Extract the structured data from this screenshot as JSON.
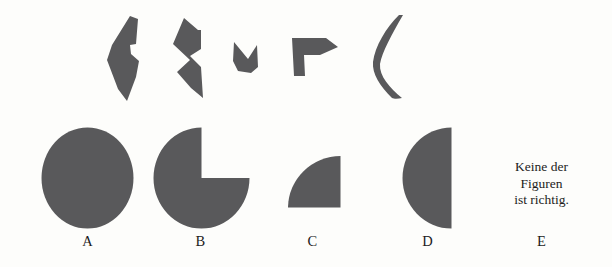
{
  "page": {
    "kind": "shape-assembly test item",
    "language": "de",
    "background_color": "#fdfdfb",
    "figure_fill_color": "#59595b"
  },
  "pieces": {
    "caption": "",
    "count": 5,
    "items": [
      {
        "name": "piece-1",
        "description": "tall narrow polygon with notch on right side"
      },
      {
        "name": "piece-2",
        "description": "arrow-like zigzag polygon pointing right"
      },
      {
        "name": "piece-3",
        "description": "small V-notched wedge"
      },
      {
        "name": "piece-4",
        "description": "flag-like polygon with pointed right tip"
      },
      {
        "name": "piece-5",
        "description": "thin crescent / bracket curve"
      }
    ]
  },
  "options": [
    {
      "label": "A",
      "shape": "full-circle",
      "description": "complete filled circle"
    },
    {
      "label": "B",
      "shape": "circle-with-quarter-notch",
      "description": "filled circle with upper-right quarter removed"
    },
    {
      "label": "C",
      "shape": "quarter-circle",
      "description": "quarter disc with right angle at lower right"
    },
    {
      "label": "D",
      "shape": "half-circle",
      "description": "left half disc with flat vertical edge on the right"
    },
    {
      "label": "E",
      "shape": "text",
      "description": "none of the figures is correct",
      "text_lines": [
        "Keine der",
        "Figuren",
        "ist richtig."
      ]
    }
  ]
}
